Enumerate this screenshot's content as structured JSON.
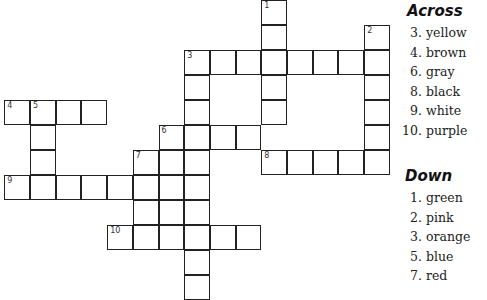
{
  "puzzle": {
    "cell_size": 25.7,
    "origin": {
      "x": 5,
      "y": 1
    },
    "words": [
      {
        "number": "1",
        "direction": "down",
        "row": 0,
        "col": 10,
        "length": 5
      },
      {
        "number": "2",
        "direction": "down",
        "row": 1,
        "col": 14,
        "length": 6
      },
      {
        "number": "3",
        "direction": "across",
        "row": 2,
        "col": 7,
        "length": 8
      },
      {
        "number": "3",
        "direction": "down",
        "row": 2,
        "col": 7,
        "length": 10
      },
      {
        "number": "4",
        "direction": "across",
        "row": 4,
        "col": 0,
        "length": 4
      },
      {
        "number": "5",
        "direction": "down",
        "row": 4,
        "col": 1,
        "length": 4
      },
      {
        "number": "6",
        "direction": "across",
        "row": 5,
        "col": 6,
        "length": 4
      },
      {
        "number": "",
        "direction": "down",
        "row": 5,
        "col": 6,
        "length": 5
      },
      {
        "number": "7",
        "direction": "down",
        "row": 6,
        "col": 5,
        "length": 4
      },
      {
        "number": "8",
        "direction": "across",
        "row": 6,
        "col": 10,
        "length": 5
      },
      {
        "number": "9",
        "direction": "across",
        "row": 7,
        "col": 0,
        "length": 6
      },
      {
        "number": "10",
        "direction": "across",
        "row": 9,
        "col": 4,
        "length": 6
      }
    ]
  },
  "across": {
    "title": "Across",
    "clues": [
      {
        "n": "3.",
        "text": "yellow"
      },
      {
        "n": "4.",
        "text": "brown"
      },
      {
        "n": "6.",
        "text": "gray"
      },
      {
        "n": "8.",
        "text": "black"
      },
      {
        "n": "9.",
        "text": "white"
      },
      {
        "n": "10.",
        "text": "purple"
      }
    ]
  },
  "down": {
    "title": "Down",
    "clues": [
      {
        "n": "1.",
        "text": "green"
      },
      {
        "n": "2.",
        "text": "pink"
      },
      {
        "n": "3.",
        "text": "orange"
      },
      {
        "n": "5.",
        "text": "blue"
      },
      {
        "n": "7.",
        "text": "red"
      }
    ]
  }
}
